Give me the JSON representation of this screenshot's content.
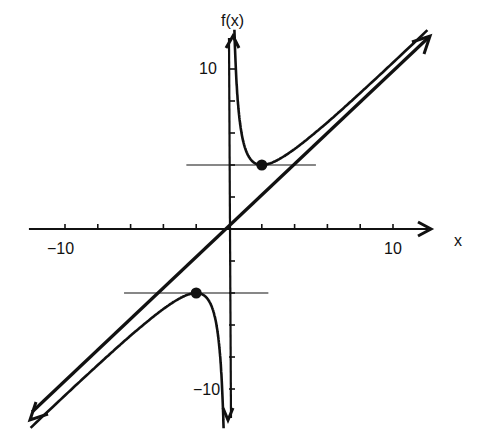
{
  "chart_data": {
    "type": "line",
    "title": "",
    "xlabel": "x",
    "ylabel": "f(x)",
    "function": "f(x) = x + 4/x",
    "xlim": [
      -12.2,
      12.4
    ],
    "ylim": [
      -12.2,
      11.8
    ],
    "x_ticks": [
      -10,
      -8,
      -6,
      -4,
      -2,
      2,
      4,
      6,
      8,
      10
    ],
    "y_ticks": [
      -10,
      -8,
      -6,
      -4,
      -2,
      2,
      4,
      6,
      8,
      10
    ],
    "x_tick_labels": [
      {
        "value": -10,
        "label": "−10"
      },
      {
        "value": 10,
        "label": "10"
      }
    ],
    "y_tick_labels": [
      {
        "value": 10,
        "label": "10"
      },
      {
        "value": -10,
        "label": "−10"
      }
    ],
    "grid": false,
    "legend": null,
    "series": [
      {
        "name": "f(x) right branch",
        "style": "solid",
        "x": [
          0.33,
          0.4,
          0.5,
          0.7,
          1,
          1.5,
          2,
          3,
          4,
          5,
          6,
          8,
          10,
          12
        ],
        "y": [
          12.45,
          10.4,
          8.5,
          6.41,
          5,
          4.17,
          4,
          4.33,
          5,
          5.8,
          6.67,
          8.5,
          10.4,
          12.33
        ]
      },
      {
        "name": "f(x) left branch",
        "style": "solid",
        "x": [
          -12,
          -10,
          -8,
          -6,
          -5,
          -4,
          -3,
          -2,
          -1.5,
          -1,
          -0.7,
          -0.5,
          -0.4,
          -0.33
        ],
        "y": [
          -12.33,
          -10.4,
          -8.5,
          -6.67,
          -5.8,
          -5,
          -4.33,
          -4,
          -4.17,
          -5,
          -6.41,
          -8.5,
          -10.4,
          -12.45
        ]
      },
      {
        "name": "asymptote y = x",
        "style": "solid-heavy",
        "x": [
          -12.2,
          12.2
        ],
        "y": [
          -12.2,
          12.2
        ]
      }
    ],
    "annotations": [
      {
        "type": "point",
        "label": "local minimum",
        "x": 2,
        "y": 4
      },
      {
        "type": "point",
        "label": "local maximum",
        "x": -2,
        "y": -4
      },
      {
        "type": "hline",
        "label": "horizontal tangent at minimum",
        "y": 4,
        "x_range": [
          -2.6,
          5.3
        ]
      },
      {
        "type": "hline",
        "label": "horizontal tangent at maximum",
        "y": -4,
        "x_range": [
          -6.4,
          2.4
        ]
      }
    ]
  },
  "labels": {
    "x_axis": "x",
    "y_axis": "f(x)",
    "x_neg10": "−10",
    "x_pos10": "10",
    "y_pos10": "10",
    "y_neg10": "−10"
  }
}
